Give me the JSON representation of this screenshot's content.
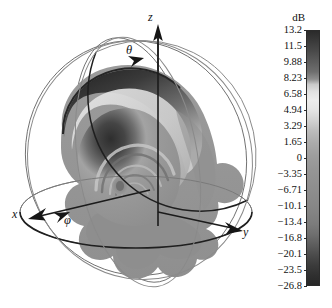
{
  "figure": {
    "kind": "3d-radiation-pattern-plot",
    "background_color": "#ffffff"
  },
  "plot": {
    "axes": [
      {
        "name": "x-axis",
        "label": "x"
      },
      {
        "name": "y-axis",
        "label": "y"
      },
      {
        "name": "z-axis",
        "label": "z"
      }
    ],
    "angles": [
      {
        "name": "theta-angle",
        "label": "θ"
      },
      {
        "name": "phi-angle",
        "label": "φ"
      }
    ]
  },
  "colorbar": {
    "title": "dB",
    "orientation": "vertical",
    "max": 13.2,
    "min": -26.8,
    "tick_labels": [
      "13.2",
      "11.5",
      "9.88",
      "8.23",
      "6.58",
      "4.94",
      "3.29",
      "1.65",
      "0",
      "−3.35",
      "−6.71",
      "−10.1",
      "−13.4",
      "−16.8",
      "−20.1",
      "−23.5",
      "−26.8"
    ],
    "tick_values": [
      13.2,
      11.5,
      9.88,
      8.23,
      6.58,
      4.94,
      3.29,
      1.65,
      0,
      -3.35,
      -6.71,
      -10.1,
      -13.4,
      -16.8,
      -20.1,
      -23.5,
      -26.8
    ]
  },
  "chart_data": {
    "type": "heatmap",
    "title": "",
    "subtitle": "",
    "xlabel": "x",
    "ylabel": "y",
    "zlabel": "z",
    "colorbar_label": "dB",
    "colorbar_range": [
      -26.8,
      13.2
    ],
    "colorbar_ticks": [
      13.2,
      11.5,
      9.88,
      8.23,
      6.58,
      4.94,
      3.29,
      1.65,
      0,
      -3.35,
      -6.71,
      -10.1,
      -13.4,
      -16.8,
      -20.1,
      -23.5,
      -26.8
    ],
    "colorbar_tick_labels": [
      "13.2",
      "11.5",
      "9.88",
      "8.23",
      "6.58",
      "4.94",
      "3.29",
      "1.65",
      "0",
      "−3.35",
      "−6.71",
      "−10.1",
      "−13.4",
      "−16.8",
      "−20.1",
      "−23.5",
      "−26.8"
    ],
    "colormap": "grayscale",
    "grid": false,
    "legend_position": "right",
    "annotations": [
      "x",
      "y",
      "z",
      "θ",
      "φ"
    ]
  }
}
